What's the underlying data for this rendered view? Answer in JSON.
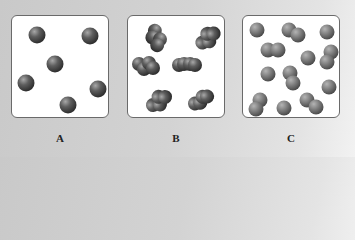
{
  "panels": [
    {
      "label": "A",
      "description": "monatomic particles (6 single spheres)"
    },
    {
      "label": "B",
      "description": "polyatomic molecules (6 four-atom molecules)"
    },
    {
      "label": "C",
      "description": "mixture of single atoms and diatomic molecules"
    }
  ],
  "colors": {
    "sphere_dark": "#4a4a4a",
    "sphere_mid": "#6e6e6e",
    "sphere_light": "#9a9a9a",
    "panel_bg": "#ffffff",
    "panel_border": "#6a6a6a"
  }
}
